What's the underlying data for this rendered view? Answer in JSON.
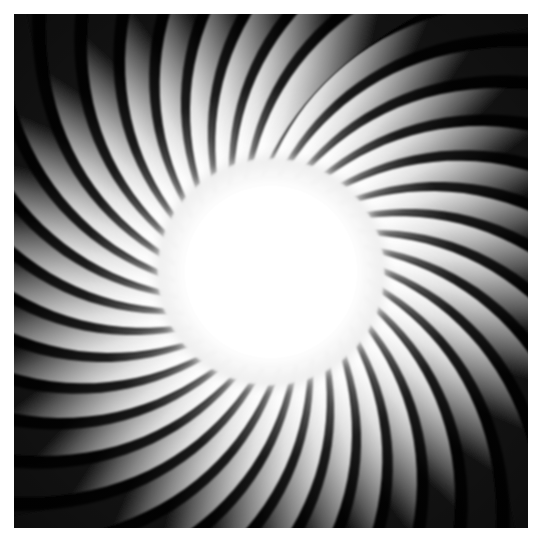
{
  "image": {
    "subject": "jet-engine-turbofan",
    "description": "Head-on photograph of an aircraft turbofan engine fan showing curved blades radiating from a brightly lit central hub",
    "orientation": "front-view",
    "rotation_direction": "counter-clockwise-sweep",
    "margin_px": 14,
    "content_width_px": 514,
    "content_height_px": 514
  },
  "geometry": {
    "center_x": 257,
    "center_y": 258,
    "hub_radius": 98,
    "hub_glow_radius": 118,
    "blade_count": 36,
    "blade_inner_radius": 96,
    "blade_outer_radius": 420,
    "blade_sweep_degrees": 52,
    "blade_half_width_degrees": 5.0
  },
  "colors": {
    "background": "#ffffff",
    "hub_core": "#ffffff",
    "hub_edge": "#f2f2f2",
    "blade_highlight": "#ffffff",
    "blade_midtone": "#b4b4b4",
    "blade_shadow": "#3a3a3a",
    "gap_shadow": "#0b0b0b",
    "vignette": "#000000",
    "caption_text": "#d8d8d8"
  },
  "caption": {
    "text": "",
    "visible": false,
    "note": "faint illegible fragment clipped at bottom edge"
  }
}
